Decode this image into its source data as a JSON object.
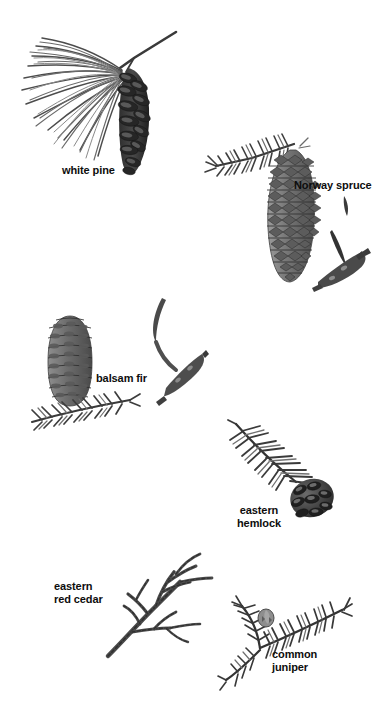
{
  "plate": {
    "title": "Conifer identification plate",
    "background_color": "#ffffff",
    "width": 387,
    "height": 703,
    "style": "grayscale botanical photo illustrations with bold black labels"
  },
  "palette": {
    "background": "#ffffff",
    "label_text": "#0d0d0d",
    "ink_dark": "#2b2b2b",
    "ink_mid": "#6e6e6e",
    "ink_light": "#a8a8a8",
    "cone_dark": "#3a3a3a",
    "cone_mid": "#7d7d7d",
    "cone_light": "#b4b4b4"
  },
  "specimens": [
    {
      "id": "white-pine",
      "label": "white pine",
      "label_lines": [
        "white pine"
      ],
      "label_align": "left",
      "parts": "long needle fascicle spray with long drooping cone",
      "cone_shape": "long narrow drooping",
      "cone_tone": "dark"
    },
    {
      "id": "norway-spruce",
      "label": "Norway spruce",
      "label_lines": [
        "Norway spruce"
      ],
      "label_align": "left",
      "parts": "large pendant cone with needled twig, plus detached needle and twig inset",
      "cone_shape": "long cylindrical pendant",
      "cone_tone": "mid gray with diamond scales"
    },
    {
      "id": "balsam-fir",
      "label": "balsam fir",
      "label_lines": [
        "balsam fir"
      ],
      "label_align": "left",
      "parts": "upright barrel cone above flat needled spray, plus curved needle and twig inset",
      "cone_shape": "upright barrel",
      "cone_tone": "mid gray"
    },
    {
      "id": "eastern-hemlock",
      "label": "eastern hemlock",
      "label_lines": [
        "eastern",
        "hemlock"
      ],
      "label_align": "center",
      "parts": "flat needled twig with small rounded cone at tip",
      "cone_shape": "small rounded",
      "cone_tone": "dark"
    },
    {
      "id": "eastern-red-cedar",
      "label": "eastern red cedar",
      "label_lines": [
        "eastern",
        "red cedar"
      ],
      "label_align": "left",
      "parts": "branching scale-leaf frond",
      "cone_shape": "none visible",
      "cone_tone": "n/a"
    },
    {
      "id": "common-juniper",
      "label": "common juniper",
      "label_lines": [
        "common",
        "juniper"
      ],
      "label_align": "left",
      "parts": "awl-needled spray with small berry-like cone",
      "cone_shape": "small round berry",
      "cone_tone": "mid gray"
    }
  ]
}
